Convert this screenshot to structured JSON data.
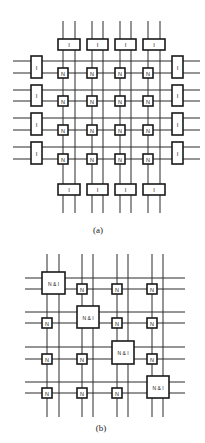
{
  "figure_a": {
    "caption": "(a)",
    "node_label": "N",
    "io_label": "I",
    "columns": [
      {
        "x1": 63,
        "x2": 75
      },
      {
        "x1": 92,
        "x2": 103
      },
      {
        "x1": 120,
        "x2": 131
      },
      {
        "x1": 148,
        "x2": 160
      }
    ],
    "rows": [
      {
        "y1": 61,
        "y2": 73
      },
      {
        "y1": 90,
        "y2": 101
      },
      {
        "y1": 118,
        "y2": 130
      },
      {
        "y1": 147,
        "y2": 159
      }
    ],
    "vertical_extent": [
      21,
      213
    ],
    "horizontal_extent": [
      13,
      200
    ],
    "top_io_y": [
      39,
      50
    ],
    "bottom_io_y": [
      184,
      195
    ],
    "left_io_x": [
      31,
      42
    ],
    "right_io_x": [
      172,
      183
    ]
  },
  "figure_b": {
    "caption": "(b)",
    "node_label": "N",
    "combined_label": "N & I",
    "columns": [
      {
        "x1": 47,
        "x2": 59
      },
      {
        "x1": 82,
        "x2": 93
      },
      {
        "x1": 117,
        "x2": 128
      },
      {
        "x1": 152,
        "x2": 163
      }
    ],
    "rows": [
      {
        "y1": 278,
        "y2": 289
      },
      {
        "y1": 312,
        "y2": 323
      },
      {
        "y1": 347,
        "y2": 359
      },
      {
        "y1": 382,
        "y2": 393
      }
    ],
    "vertical_extent": [
      254,
      417
    ],
    "horizontal_extent": [
      25,
      185
    ]
  },
  "captions": {
    "a": "(a)",
    "b": "(b)"
  }
}
